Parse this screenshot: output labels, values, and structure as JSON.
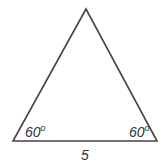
{
  "diagram": {
    "type": "triangle",
    "angles": {
      "bottom_left": "60",
      "bottom_right": "60",
      "degree_symbol": "o"
    },
    "side_labels": {
      "base": "5"
    },
    "stroke_color": "#444444"
  }
}
